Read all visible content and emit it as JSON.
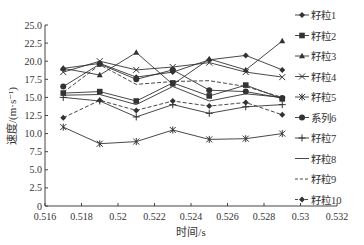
{
  "chart_data": {
    "type": "line",
    "title": "",
    "xlabel": "时间/s",
    "ylabel": "速度/(m·s⁻¹)",
    "xlim": [
      0.516,
      0.532
    ],
    "ylim": [
      0,
      25
    ],
    "x_ticks": [
      "0.516",
      "0.518",
      "0.52",
      "0.522",
      "0.524",
      "0.526",
      "0.528",
      "0.53",
      "0.532"
    ],
    "y_ticks": [
      "0",
      "2.5",
      "5.0",
      "7.5",
      "10.0",
      "12.5",
      "15.0",
      "17.5",
      "20.0",
      "22.5",
      "25.0"
    ],
    "grid": false,
    "legend_position": "right",
    "x": [
      0.517,
      0.519,
      0.521,
      0.523,
      0.525,
      0.527,
      0.529
    ],
    "series": [
      {
        "name": "籽粒1",
        "marker": "diamond",
        "dash": "solid",
        "values": [
          19.0,
          19.7,
          17.8,
          18.5,
          20.2,
          20.8,
          18.8
        ]
      },
      {
        "name": "籽粒2",
        "marker": "square",
        "dash": "solid",
        "values": [
          15.6,
          15.8,
          14.5,
          17.0,
          15.2,
          16.7,
          14.8
        ]
      },
      {
        "name": "籽粒3",
        "marker": "triangle",
        "dash": "solid",
        "values": [
          19.0,
          18.1,
          21.2,
          16.8,
          20.3,
          18.8,
          22.8
        ]
      },
      {
        "name": "籽粒4",
        "marker": "x",
        "dash": "solid",
        "values": [
          18.5,
          20.0,
          18.8,
          19.2,
          19.8,
          18.5,
          17.8
        ]
      },
      {
        "name": "籽粒5",
        "marker": "asterisk",
        "dash": "solid",
        "values": [
          10.9,
          8.6,
          8.9,
          10.5,
          9.2,
          9.3,
          10.0
        ]
      },
      {
        "name": "系列6",
        "marker": "circle",
        "dash": "solid",
        "values": [
          16.5,
          19.6,
          17.5,
          18.8,
          16.0,
          15.8,
          14.9
        ]
      },
      {
        "name": "籽粒7",
        "marker": "plus",
        "dash": "solid",
        "values": [
          15.0,
          14.5,
          12.3,
          14.0,
          12.8,
          13.7,
          14.0
        ]
      },
      {
        "name": "籽粒8",
        "marker": "none",
        "dash": "solid",
        "values": [
          15.3,
          15.4,
          14.0,
          16.5,
          14.5,
          15.5,
          15.0
        ]
      },
      {
        "name": "籽粒9",
        "marker": "none",
        "dash": "dashed",
        "values": [
          15.7,
          19.5,
          16.8,
          17.2,
          17.3,
          16.5,
          15.0
        ]
      },
      {
        "name": "籽粒10",
        "marker": "diamond",
        "dash": "dashed",
        "values": [
          12.2,
          14.6,
          13.2,
          14.5,
          13.8,
          14.3,
          12.6
        ]
      }
    ]
  },
  "colors": {
    "line": "#333333",
    "axis": "#444444"
  }
}
